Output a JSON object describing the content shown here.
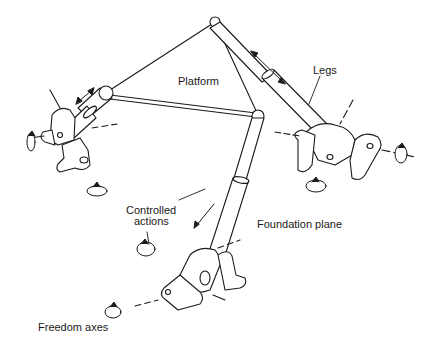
{
  "diagram": {
    "labels": {
      "platform": "Platform",
      "legs": "Legs",
      "controlled_actions": "Controlled\nactions",
      "controlled_actions_line1": "Controlled",
      "controlled_actions_line2": "actions",
      "foundation_plane": "Foundation plane",
      "freedom_axes": "Freedom axes"
    },
    "colors": {
      "ink": "#1a1a1a",
      "background": "#ffffff"
    },
    "nodes": {
      "platform_top": [
        215,
        22
      ],
      "platform_left": [
        107,
        92
      ],
      "platform_right": [
        258,
        115
      ]
    },
    "joints": [
      "left-base-joint",
      "right-base-joint",
      "bottom-base-joint"
    ]
  }
}
